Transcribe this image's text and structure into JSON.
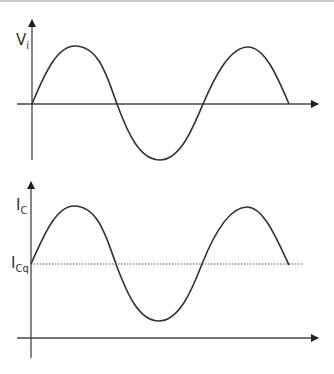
{
  "diagram": {
    "top_plot": {
      "y_label": "V",
      "y_label_sub": "i",
      "description": "Sinusoidal input voltage centered on time axis"
    },
    "bottom_plot": {
      "y_label": "I",
      "y_label_sub": "C",
      "q_label": "I",
      "q_label_sub": "Cq",
      "description": "Sinusoidal collector current centered on quiescent level ICq (dotted line)"
    },
    "colors": {
      "axis": "#444444",
      "wave": "#333333",
      "dotted": "#555555",
      "border": "#c8c8c8"
    }
  }
}
